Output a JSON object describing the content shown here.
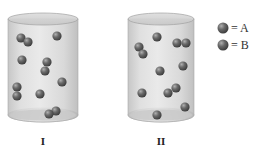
{
  "containers": [
    {
      "label": "I",
      "x": 8,
      "width": 70,
      "top": 19,
      "bottom": 115,
      "particles": [
        {
          "x": 21,
          "y": 38,
          "type": "A"
        },
        {
          "x": 28,
          "y": 42,
          "type": "B"
        },
        {
          "x": 57,
          "y": 36,
          "type": "A"
        },
        {
          "x": 22,
          "y": 60,
          "type": "B"
        },
        {
          "x": 47,
          "y": 62,
          "type": "A"
        },
        {
          "x": 45,
          "y": 71,
          "type": "B"
        },
        {
          "x": 62,
          "y": 82,
          "type": "A"
        },
        {
          "x": 17,
          "y": 87,
          "type": "A"
        },
        {
          "x": 17,
          "y": 96,
          "type": "B"
        },
        {
          "x": 40,
          "y": 94,
          "type": "A"
        },
        {
          "x": 56,
          "y": 111,
          "type": "B"
        },
        {
          "x": 49,
          "y": 114,
          "type": "A"
        }
      ]
    },
    {
      "label": "II",
      "x": 128,
      "width": 66,
      "top": 19,
      "bottom": 115,
      "particles": [
        {
          "x": 157,
          "y": 37,
          "type": "A"
        },
        {
          "x": 139,
          "y": 47,
          "type": "B"
        },
        {
          "x": 143,
          "y": 54,
          "type": "A"
        },
        {
          "x": 177,
          "y": 43,
          "type": "A"
        },
        {
          "x": 186,
          "y": 43,
          "type": "B"
        },
        {
          "x": 160,
          "y": 71,
          "type": "A"
        },
        {
          "x": 183,
          "y": 66,
          "type": "B"
        },
        {
          "x": 142,
          "y": 93,
          "type": "A"
        },
        {
          "x": 168,
          "y": 93,
          "type": "B"
        },
        {
          "x": 176,
          "y": 88,
          "type": "A"
        },
        {
          "x": 185,
          "y": 107,
          "type": "B"
        },
        {
          "x": 157,
          "y": 115,
          "type": "A"
        }
      ]
    }
  ],
  "legend": [
    {
      "type": "A",
      "text": "= A",
      "color": "#5a5a5a"
    },
    {
      "type": "B",
      "text": "= B",
      "color": "#5a5a5a"
    }
  ],
  "colors": {
    "particle": "#5a5a5a",
    "particle_highlight": "#9a9a9a",
    "cylinder_body": "#d4d4d4",
    "cylinder_edge": "#a8a8a8"
  }
}
